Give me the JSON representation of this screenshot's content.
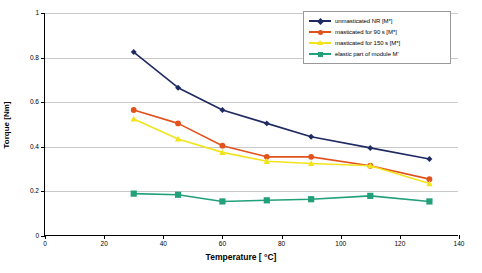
{
  "chart_data": {
    "type": "line",
    "title": "",
    "xlabel": "Temperature [ °C]",
    "ylabel": "Torque [Nm]",
    "x": [
      30,
      45,
      60,
      75,
      90,
      110,
      130
    ],
    "xlim": [
      0,
      140
    ],
    "ylim": [
      0,
      1
    ],
    "xticks": [
      0,
      20,
      40,
      60,
      80,
      100,
      120,
      140
    ],
    "yticks": [
      0,
      0.2,
      0.4,
      0.6,
      0.8,
      1
    ],
    "xtick_labels": [
      "0",
      "20",
      "40",
      "60",
      "80",
      "100",
      "120",
      "140"
    ],
    "ytick_labels": [
      "0",
      "0.2",
      "0.4",
      "0.6",
      "0.8",
      "1"
    ],
    "grid": "horizontal",
    "legend_position": "top-right",
    "series": [
      {
        "name": "unmasticated NR [M*]",
        "color": "#1f2a63",
        "marker": "diamond",
        "values": [
          0.825,
          0.665,
          0.565,
          0.505,
          0.445,
          0.395,
          0.345
        ]
      },
      {
        "name": "masticated for 90 s [M*]",
        "color": "#e2521d",
        "marker": "circle",
        "values": [
          0.565,
          0.505,
          0.405,
          0.355,
          0.355,
          0.315,
          0.255
        ]
      },
      {
        "name": "masticated for 150 s [M*]",
        "color": "#f2e41c",
        "marker": "triangle",
        "values": [
          0.525,
          0.435,
          0.375,
          0.335,
          0.325,
          0.315,
          0.235
        ]
      },
      {
        "name": "elastic part of module M'",
        "color": "#22a07a",
        "marker": "square",
        "values": [
          0.19,
          0.185,
          0.155,
          0.16,
          0.165,
          0.18,
          0.155
        ]
      }
    ]
  }
}
